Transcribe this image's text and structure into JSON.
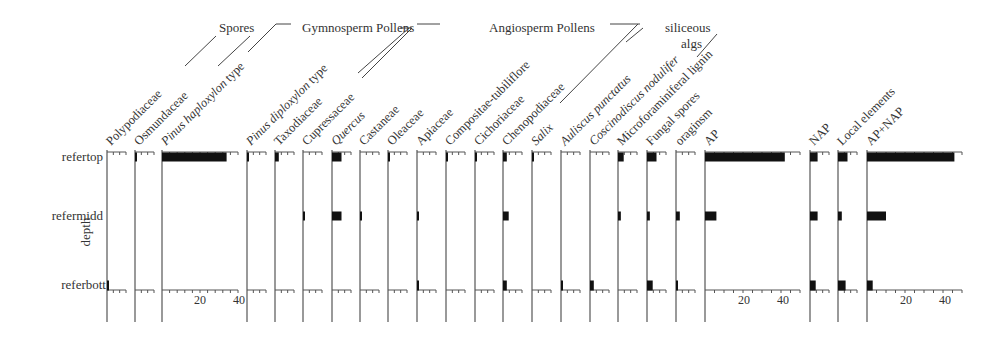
{
  "chart_data": {
    "type": "bar",
    "subtype": "stratigraphic-diagram (horizontal bars per depth)",
    "ylabel": "depth",
    "depths": [
      "refertop",
      "refermidd",
      "referbott"
    ],
    "groups": [
      {
        "label": "Spores",
        "members": [
          "Polypodiaceae",
          "Osmundaceae"
        ]
      },
      {
        "label": "Gymnosperm Pollens",
        "members": [
          "Pinus haploxylon type",
          "Pinus diploxylon type",
          "Taxodiaceae",
          "Cupressaceae"
        ]
      },
      {
        "label": "Angiosperm Pollens",
        "members": [
          "Quercus",
          "Castaneae",
          "Oleaceae",
          "Apiaceae",
          "Compositae-tubiliflore",
          "Cichoriaceae",
          "Chenopodiaceae",
          "Salix"
        ]
      },
      {
        "label": "siliceous algs",
        "members": [
          "Auliscus punctatus",
          "Coscinodiscus nodulifer"
        ]
      }
    ],
    "series": [
      {
        "name": "Polypodiaceae",
        "italic": false,
        "values": [
          0,
          0,
          0.5
        ]
      },
      {
        "name": "Osmundaceae",
        "italic": false,
        "values": [
          1,
          0,
          0
        ]
      },
      {
        "name": "Pinus haploxylon type",
        "italic_part": "Pinus haploxylon",
        "values": [
          34,
          0,
          0
        ],
        "axis": {
          "max": 40,
          "ticks": [
            20,
            40
          ]
        }
      },
      {
        "name": "Pinus diploxylon type",
        "italic_part": "Pinus diploxylon",
        "values": [
          0.5,
          0,
          0
        ]
      },
      {
        "name": "Taxodiaceae",
        "italic": false,
        "values": [
          2,
          0,
          0
        ]
      },
      {
        "name": "Cupressaceae",
        "italic": false,
        "values": [
          0,
          1,
          0
        ]
      },
      {
        "name": "Quercus",
        "italic": true,
        "values": [
          5,
          5,
          0
        ]
      },
      {
        "name": "Castaneae",
        "italic": false,
        "values": [
          0,
          1,
          0
        ]
      },
      {
        "name": "Oleaceae",
        "italic": false,
        "values": [
          1,
          0,
          0
        ]
      },
      {
        "name": "Apiaceae",
        "italic": false,
        "values": [
          0,
          0.5,
          1
        ]
      },
      {
        "name": "Compositae-tubiliflore",
        "italic": false,
        "values": [
          1,
          0,
          0
        ]
      },
      {
        "name": "Cichoriaceae",
        "italic": false,
        "values": [
          0.5,
          0,
          0
        ]
      },
      {
        "name": "Chenopodiaceae",
        "italic": false,
        "values": [
          2,
          3,
          2
        ]
      },
      {
        "name": "Salix",
        "italic": true,
        "values": [
          0.5,
          0,
          0
        ]
      },
      {
        "name": "Auliscus punctatus",
        "italic": true,
        "values": [
          0,
          0,
          1
        ]
      },
      {
        "name": "Coscinodiscus nodulifer",
        "italic": true,
        "values": [
          0,
          0,
          2
        ]
      },
      {
        "name": "Microforaminiferal lignin",
        "italic": false,
        "values": [
          3,
          1.5,
          0
        ]
      },
      {
        "name": "Fungal spores",
        "italic": false,
        "values": [
          5,
          1.5,
          3
        ]
      },
      {
        "name": "oraginsm",
        "italic": false,
        "values": [
          0,
          2,
          1
        ]
      },
      {
        "name": "AP",
        "italic": false,
        "values": [
          42,
          6,
          0
        ],
        "axis": {
          "max": 50,
          "ticks": [
            20,
            40
          ]
        }
      },
      {
        "name": "NAP",
        "italic": false,
        "values": [
          4,
          4,
          3
        ]
      },
      {
        "name": "Local elements",
        "italic": false,
        "values": [
          5,
          2,
          4
        ]
      },
      {
        "name": "AP+NAP",
        "italic": false,
        "values": [
          46,
          10,
          3
        ],
        "axis": {
          "max": 50,
          "ticks": [
            20,
            40
          ]
        }
      }
    ],
    "grid": false,
    "legend": "none"
  },
  "labels": {
    "ylabel": "depth",
    "depth_top": "refertop",
    "depth_mid": "refermidd",
    "depth_bot": "referbott",
    "group_spores": "Spores",
    "group_gymno": "Gymnosperm Pollens",
    "group_angio": "Angiosperm Pollens",
    "group_silic_1": "siliceous",
    "group_silic_2": "algs",
    "tick_20a": "20",
    "tick_40a": "40",
    "tick_20b": "20",
    "tick_40b": "40",
    "tick_20c": "20",
    "tick_40c": "40"
  },
  "colors": {
    "bar": "#111111",
    "axis": "#555555",
    "text": "#333333"
  }
}
